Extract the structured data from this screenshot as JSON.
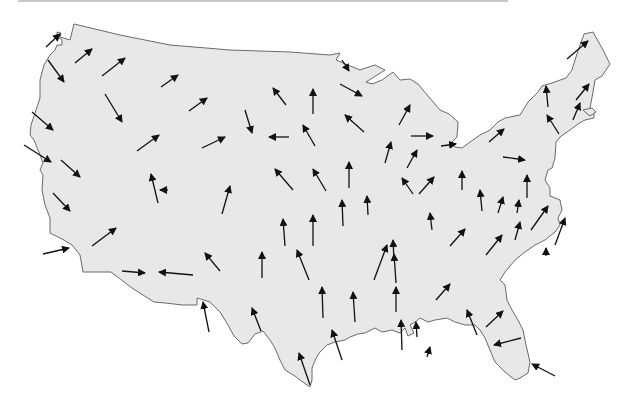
{
  "map": {
    "title": "",
    "type": "vector-field-map",
    "region": "contiguous-united-states",
    "colors": {
      "land": "#e8e8e8",
      "border": "#6a6a6a",
      "arrow": "#111111",
      "background": "#ffffff"
    },
    "arrows": [
      {
        "x1": 46,
        "y1": 47,
        "x2": 60,
        "y2": 34
      },
      {
        "x1": 75,
        "y1": 63,
        "x2": 92,
        "y2": 49
      },
      {
        "x1": 48,
        "y1": 60,
        "x2": 64,
        "y2": 82
      },
      {
        "x1": 102,
        "y1": 76,
        "x2": 125,
        "y2": 58
      },
      {
        "x1": 161,
        "y1": 87,
        "x2": 178,
        "y2": 75
      },
      {
        "x1": 189,
        "y1": 111,
        "x2": 207,
        "y2": 98
      },
      {
        "x1": 105,
        "y1": 94,
        "x2": 122,
        "y2": 122
      },
      {
        "x1": 32,
        "y1": 112,
        "x2": 53,
        "y2": 130
      },
      {
        "x1": 24,
        "y1": 145,
        "x2": 51,
        "y2": 162
      },
      {
        "x1": 61,
        "y1": 160,
        "x2": 80,
        "y2": 177
      },
      {
        "x1": 137,
        "y1": 151,
        "x2": 159,
        "y2": 135
      },
      {
        "x1": 202,
        "y1": 148,
        "x2": 225,
        "y2": 137
      },
      {
        "x1": 245,
        "y1": 110,
        "x2": 252,
        "y2": 133
      },
      {
        "x1": 289,
        "y1": 137,
        "x2": 269,
        "y2": 137
      },
      {
        "x1": 286,
        "y1": 105,
        "x2": 273,
        "y2": 88
      },
      {
        "x1": 313,
        "y1": 114,
        "x2": 313,
        "y2": 89
      },
      {
        "x1": 315,
        "y1": 146,
        "x2": 303,
        "y2": 125
      },
      {
        "x1": 293,
        "y1": 190,
        "x2": 275,
        "y2": 169
      },
      {
        "x1": 326,
        "y1": 191,
        "x2": 313,
        "y2": 169
      },
      {
        "x1": 349,
        "y1": 188,
        "x2": 349,
        "y2": 162
      },
      {
        "x1": 342,
        "y1": 60,
        "x2": 349,
        "y2": 71
      },
      {
        "x1": 340,
        "y1": 84,
        "x2": 362,
        "y2": 96
      },
      {
        "x1": 364,
        "y1": 132,
        "x2": 345,
        "y2": 115
      },
      {
        "x1": 399,
        "y1": 125,
        "x2": 410,
        "y2": 105
      },
      {
        "x1": 411,
        "y1": 136,
        "x2": 433,
        "y2": 136
      },
      {
        "x1": 441,
        "y1": 146,
        "x2": 456,
        "y2": 144
      },
      {
        "x1": 385,
        "y1": 163,
        "x2": 391,
        "y2": 142
      },
      {
        "x1": 407,
        "y1": 168,
        "x2": 417,
        "y2": 150
      },
      {
        "x1": 419,
        "y1": 194,
        "x2": 434,
        "y2": 177
      },
      {
        "x1": 462,
        "y1": 190,
        "x2": 462,
        "y2": 171
      },
      {
        "x1": 489,
        "y1": 142,
        "x2": 504,
        "y2": 129
      },
      {
        "x1": 503,
        "y1": 157,
        "x2": 525,
        "y2": 160
      },
      {
        "x1": 548,
        "y1": 107,
        "x2": 546,
        "y2": 86
      },
      {
        "x1": 559,
        "y1": 134,
        "x2": 547,
        "y2": 115
      },
      {
        "x1": 567,
        "y1": 59,
        "x2": 588,
        "y2": 41
      },
      {
        "x1": 573,
        "y1": 120,
        "x2": 580,
        "y2": 103
      },
      {
        "x1": 576,
        "y1": 100,
        "x2": 589,
        "y2": 84
      },
      {
        "x1": 158,
        "y1": 203,
        "x2": 151,
        "y2": 174
      },
      {
        "x1": 222,
        "y1": 214,
        "x2": 230,
        "y2": 186
      },
      {
        "x1": 168,
        "y1": 190,
        "x2": 160,
        "y2": 190
      },
      {
        "x1": 53,
        "y1": 193,
        "x2": 70,
        "y2": 211
      },
      {
        "x1": 92,
        "y1": 246,
        "x2": 116,
        "y2": 228
      },
      {
        "x1": 43,
        "y1": 254,
        "x2": 69,
        "y2": 248
      },
      {
        "x1": 122,
        "y1": 271,
        "x2": 145,
        "y2": 273
      },
      {
        "x1": 193,
        "y1": 275,
        "x2": 159,
        "y2": 272
      },
      {
        "x1": 220,
        "y1": 271,
        "x2": 205,
        "y2": 253
      },
      {
        "x1": 262,
        "y1": 278,
        "x2": 262,
        "y2": 252
      },
      {
        "x1": 285,
        "y1": 246,
        "x2": 283,
        "y2": 219
      },
      {
        "x1": 313,
        "y1": 246,
        "x2": 313,
        "y2": 215
      },
      {
        "x1": 309,
        "y1": 280,
        "x2": 297,
        "y2": 250
      },
      {
        "x1": 343,
        "y1": 226,
        "x2": 342,
        "y2": 200
      },
      {
        "x1": 368,
        "y1": 215,
        "x2": 367,
        "y2": 196
      },
      {
        "x1": 374,
        "y1": 280,
        "x2": 387,
        "y2": 245
      },
      {
        "x1": 394,
        "y1": 260,
        "x2": 393,
        "y2": 240
      },
      {
        "x1": 396,
        "y1": 283,
        "x2": 394,
        "y2": 254
      },
      {
        "x1": 413,
        "y1": 194,
        "x2": 402,
        "y2": 178
      },
      {
        "x1": 432,
        "y1": 230,
        "x2": 430,
        "y2": 213
      },
      {
        "x1": 450,
        "y1": 246,
        "x2": 465,
        "y2": 229
      },
      {
        "x1": 482,
        "y1": 211,
        "x2": 480,
        "y2": 190
      },
      {
        "x1": 498,
        "y1": 213,
        "x2": 503,
        "y2": 197
      },
      {
        "x1": 486,
        "y1": 255,
        "x2": 502,
        "y2": 235
      },
      {
        "x1": 517,
        "y1": 213,
        "x2": 519,
        "y2": 200
      },
      {
        "x1": 527,
        "y1": 198,
        "x2": 527,
        "y2": 175
      },
      {
        "x1": 515,
        "y1": 240,
        "x2": 520,
        "y2": 222
      },
      {
        "x1": 531,
        "y1": 230,
        "x2": 548,
        "y2": 206
      },
      {
        "x1": 555,
        "y1": 245,
        "x2": 565,
        "y2": 218
      },
      {
        "x1": 546,
        "y1": 256,
        "x2": 546,
        "y2": 248
      },
      {
        "x1": 209,
        "y1": 332,
        "x2": 203,
        "y2": 302
      },
      {
        "x1": 261,
        "y1": 331,
        "x2": 252,
        "y2": 308
      },
      {
        "x1": 323,
        "y1": 318,
        "x2": 322,
        "y2": 287
      },
      {
        "x1": 355,
        "y1": 322,
        "x2": 353,
        "y2": 292
      },
      {
        "x1": 342,
        "y1": 360,
        "x2": 332,
        "y2": 330
      },
      {
        "x1": 310,
        "y1": 385,
        "x2": 299,
        "y2": 353
      },
      {
        "x1": 396,
        "y1": 312,
        "x2": 396,
        "y2": 287
      },
      {
        "x1": 402,
        "y1": 350,
        "x2": 401,
        "y2": 320
      },
      {
        "x1": 417,
        "y1": 337,
        "x2": 416,
        "y2": 322
      },
      {
        "x1": 436,
        "y1": 300,
        "x2": 450,
        "y2": 284
      },
      {
        "x1": 477,
        "y1": 335,
        "x2": 467,
        "y2": 310
      },
      {
        "x1": 486,
        "y1": 327,
        "x2": 503,
        "y2": 311
      },
      {
        "x1": 521,
        "y1": 338,
        "x2": 494,
        "y2": 345
      },
      {
        "x1": 555,
        "y1": 376,
        "x2": 532,
        "y2": 364
      },
      {
        "x1": 427,
        "y1": 357,
        "x2": 430,
        "y2": 347
      }
    ]
  }
}
